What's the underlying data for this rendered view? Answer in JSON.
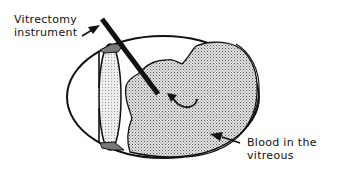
{
  "diagram": {
    "labels": {
      "instrument": {
        "line1": "Vitrectomy",
        "line2": "instrument"
      },
      "blood": {
        "line1": "Blood in the",
        "line2": "vitreous"
      }
    },
    "colors": {
      "outline": "#111111",
      "blood_fill": "#cfcfcf",
      "lens_fill": "#dcdcdc",
      "ciliary_fill": "#7a7a7a",
      "background": "#ffffff"
    }
  }
}
